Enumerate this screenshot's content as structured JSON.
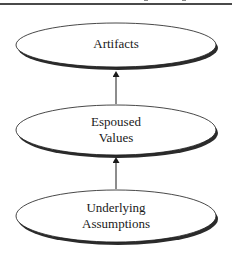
{
  "diagram": {
    "type": "layered-levels",
    "nodes": [
      {
        "id": "artifacts",
        "label": "Artifacts",
        "lines": [
          "Artifacts"
        ]
      },
      {
        "id": "espoused-values",
        "label": "Espoused Values",
        "lines": [
          "Espoused",
          "Values"
        ]
      },
      {
        "id": "underlying-assumptions",
        "label": "Underlying Assumptions",
        "lines": [
          "Underlying",
          "Assumptions"
        ]
      }
    ],
    "edges": [
      {
        "from": "espoused-values",
        "to": "artifacts",
        "style": "arrow-up"
      },
      {
        "from": "underlying-assumptions",
        "to": "espoused-values",
        "style": "arrow-up"
      }
    ],
    "colors": {
      "outline": "#1a1a1a",
      "shadow": "#2b2b2b",
      "fill": "#ffffff",
      "rule": "#4a4a4a"
    }
  }
}
